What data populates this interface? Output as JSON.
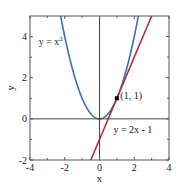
{
  "chart_data": {
    "type": "line",
    "title": "",
    "xlabel": "x",
    "ylabel": "y",
    "xlim": [
      -4,
      4
    ],
    "ylim": [
      -2,
      5
    ],
    "xticks": [
      -4,
      -2,
      0,
      2,
      4
    ],
    "xtick_labels": [
      "-4",
      "-2",
      "0",
      "2",
      "4"
    ],
    "yticks": [
      -2,
      0,
      2,
      4
    ],
    "ytick_labels": [
      "-2",
      "0",
      "2",
      "4"
    ],
    "grid": false,
    "legend": null,
    "series": [
      {
        "name": "y = x²",
        "expression": "x^2",
        "color": "#3a6fb5",
        "x": [
          -2.24,
          -2,
          -1.5,
          -1,
          -0.5,
          0,
          0.5,
          1,
          1.5,
          2,
          2.24
        ],
        "y": [
          5.0,
          4,
          2.25,
          1,
          0.25,
          0,
          0.25,
          1,
          2.25,
          4,
          5.0
        ]
      },
      {
        "name": "y = 2x - 1",
        "expression": "2x - 1",
        "color": "#b03030",
        "x": [
          -0.5,
          3
        ],
        "y": [
          -2,
          5
        ]
      }
    ],
    "points": [
      {
        "label": "(1, 1)",
        "x": 1,
        "y": 1,
        "color": "#000000"
      }
    ],
    "annotations": [
      {
        "text": "y = x",
        "superscript": "2",
        "x": -3.5,
        "y": 3.6
      },
      {
        "text": "(1, 1)",
        "x": 1.2,
        "y": 0.95
      },
      {
        "text": "y = 2x - 1",
        "x": 0.8,
        "y": -0.7
      }
    ],
    "reference_lines": [
      {
        "type": "horizontal",
        "y": 0
      },
      {
        "type": "vertical",
        "x": 0
      }
    ]
  }
}
